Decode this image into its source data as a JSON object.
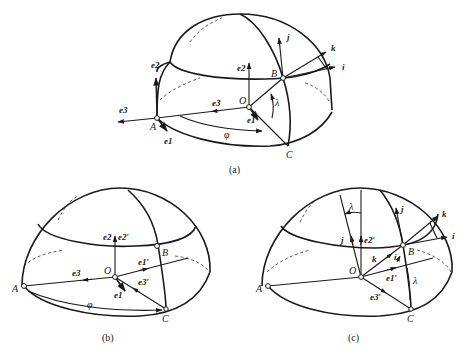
{
  "figures": [
    {
      "id": "a",
      "caption": "(a)",
      "points": {
        "A": "A",
        "B": "B",
        "C": "C",
        "O": "O"
      },
      "angles": {
        "phi": "φ",
        "lambda": "λ"
      },
      "vectors_at_A": {
        "e1": "e1",
        "e2": "e2",
        "e3": "e3"
      },
      "vectors_at_O": {
        "e1": "e1",
        "e2": "e2",
        "e3": "e3"
      },
      "vectors_at_B": {
        "i": "i",
        "j": "j",
        "k": "k"
      }
    },
    {
      "id": "b",
      "caption": "(b)",
      "points": {
        "A": "A",
        "B": "B",
        "C": "C",
        "O": "O"
      },
      "angles": {
        "phi": "φ"
      },
      "vectors_at_O": {
        "e1": "e1",
        "e2": "e2",
        "e3": "e3",
        "e1p": "e1′",
        "e2p": "e2′",
        "e3p": "e3′"
      }
    },
    {
      "id": "c",
      "caption": "(c)",
      "points": {
        "A": "A",
        "B": "B",
        "C": "C",
        "O": "O"
      },
      "angles": {
        "lambda_top": "λ",
        "lambda_side": "λ"
      },
      "vectors_at_O": {
        "j": "j",
        "e2p": "e2′",
        "k": "k",
        "i": "i",
        "e1p": "e1′",
        "e3p": "e3′"
      },
      "vectors_at_B": {
        "i": "i",
        "j": "j",
        "k": "k"
      }
    }
  ]
}
